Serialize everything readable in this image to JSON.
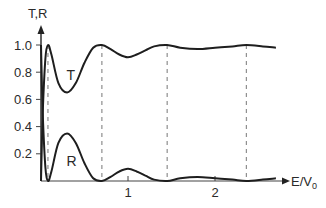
{
  "chart_data": {
    "type": "line",
    "title": "",
    "xlabel": "E/V",
    "xlabel_subscript": "0",
    "ylabel": "T,R",
    "xlim": [
      0,
      2.85
    ],
    "ylim": [
      0,
      1.05
    ],
    "grid": false,
    "legend": "inline labels",
    "x_ticks": [
      1,
      2
    ],
    "x_tick_labels": [
      "1",
      "2"
    ],
    "y_ticks": [
      0.2,
      0.4,
      0.6,
      0.8,
      1.0
    ],
    "y_tick_labels": [
      "0.2",
      "0.4",
      "0.6",
      "0.8",
      "1.0"
    ],
    "resonance_lines_x": [
      0.08,
      0.7,
      1.45,
      2.36
    ],
    "series": [
      {
        "name": "T",
        "label_pos": [
          0.35,
          0.78
        ],
        "x": [
          0,
          0.02,
          0.05,
          0.08,
          0.12,
          0.2,
          0.3,
          0.4,
          0.5,
          0.6,
          0.7,
          0.8,
          0.9,
          1.0,
          1.1,
          1.2,
          1.3,
          1.45,
          1.6,
          1.8,
          2.0,
          2.2,
          2.36,
          2.55,
          2.7
        ],
        "values": [
          0,
          0.5,
          0.9,
          1.0,
          0.93,
          0.72,
          0.65,
          0.72,
          0.87,
          0.98,
          1.0,
          0.97,
          0.93,
          0.91,
          0.93,
          0.96,
          0.99,
          1.0,
          0.98,
          0.97,
          0.98,
          0.99,
          1.0,
          0.99,
          0.98
        ]
      },
      {
        "name": "R",
        "label_pos": [
          0.35,
          0.15
        ],
        "x": [
          0,
          0.02,
          0.05,
          0.08,
          0.12,
          0.2,
          0.3,
          0.4,
          0.5,
          0.6,
          0.7,
          0.8,
          0.9,
          1.0,
          1.1,
          1.2,
          1.3,
          1.45,
          1.6,
          1.8,
          2.0,
          2.2,
          2.36,
          2.55,
          2.7
        ],
        "values": [
          1.0,
          0.5,
          0.1,
          0.0,
          0.07,
          0.28,
          0.35,
          0.28,
          0.13,
          0.02,
          0.0,
          0.03,
          0.07,
          0.09,
          0.07,
          0.04,
          0.01,
          0.0,
          0.02,
          0.03,
          0.02,
          0.01,
          0.0,
          0.01,
          0.02
        ]
      }
    ]
  }
}
